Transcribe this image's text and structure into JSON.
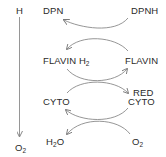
{
  "diagram": {
    "type": "electron-transport-chain",
    "axis": {
      "top_label": "H",
      "bottom_label_main": "O",
      "bottom_label_sub": "2",
      "direction": "down"
    },
    "rows": [
      {
        "left": "DPN",
        "right": "DPNH"
      },
      {
        "left_main": "FLAVIN H",
        "left_sub": "2",
        "right": "FLAVIN"
      },
      {
        "left": "CYTO",
        "right_top": "RED",
        "right": "CYTO"
      },
      {
        "left_main": "H",
        "left_sub": "2",
        "left_tail": "O",
        "right_main": "O",
        "right_sub": "2"
      }
    ],
    "colors": {
      "text": "#2a2a2a",
      "arrow": "#8a8a8a"
    }
  }
}
